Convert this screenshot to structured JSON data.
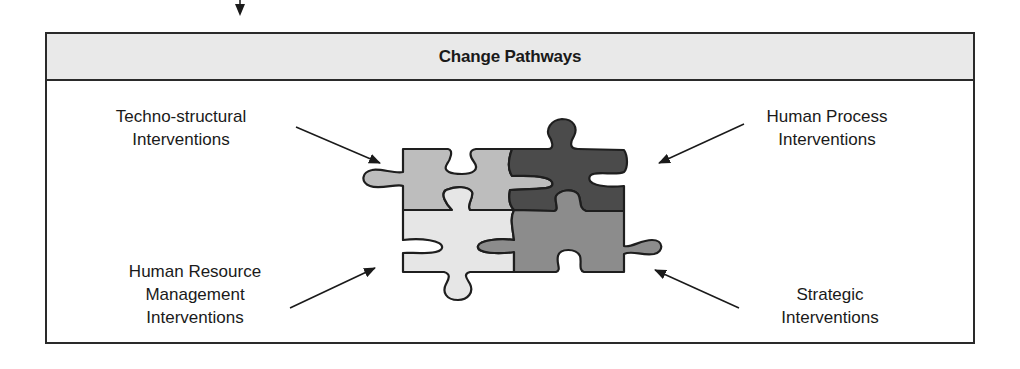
{
  "header": {
    "title": "Change Pathways"
  },
  "labels": {
    "techno_structural": {
      "line1": "Techno-structural",
      "line2": "Interventions"
    },
    "human_process": {
      "line1": "Human Process",
      "line2": "Interventions"
    },
    "hrm": {
      "line1": "Human Resource",
      "line2": "Management",
      "line3": "Interventions"
    },
    "strategic": {
      "line1": "Strategic",
      "line2": "Interventions"
    }
  },
  "colors": {
    "piece_top_left": "#bdbdbd",
    "piece_top_right": "#4b4b4b",
    "piece_bottom_left": "#e6e6e6",
    "piece_bottom_right": "#8c8c8c",
    "outline": "#1e1e1e"
  }
}
